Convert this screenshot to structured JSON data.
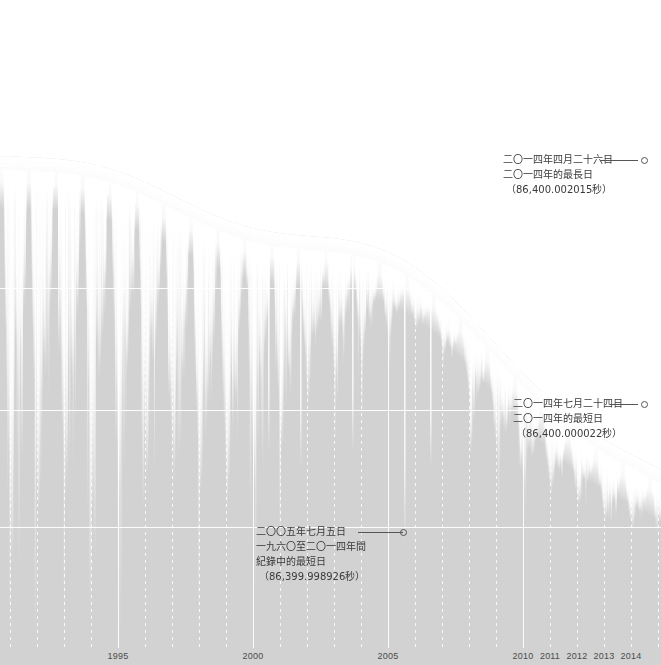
{
  "chart_data": {
    "type": "bar",
    "title": "",
    "subtitle": "",
    "xlabel": "",
    "ylabel": "",
    "grid": true,
    "legend_position": "none",
    "x_axis": {
      "tick_labels": [
        "1995",
        "2000",
        "2005",
        "2010",
        "2011",
        "2012",
        "2013",
        "2014"
      ],
      "tick_positions_px": [
        118,
        253,
        388,
        523,
        550,
        577,
        604,
        631
      ],
      "range": [
        "1960",
        "2014"
      ],
      "year_spacing_px": 27,
      "minor_gridline_years": [
        "1991",
        "1992",
        "1993",
        "1994",
        "1996",
        "1997",
        "1998",
        "1999",
        "2001",
        "2002",
        "2003",
        "2004",
        "2006",
        "2007",
        "2008",
        "2009",
        "2011",
        "2012",
        "2013",
        "2014"
      ]
    },
    "y_axis": {
      "gridline_positions_px": [
        165,
        288,
        410,
        527
      ],
      "range_seconds": [
        86399.998926,
        86400.002015
      ],
      "unit": "秒"
    },
    "annotations": [
      {
        "id": "longest-day-2014",
        "line1": "二〇一四年四月二十六日",
        "line2": "二〇一四年的最長日",
        "line3": "（86,400.002015秒）",
        "line4": "",
        "value_seconds": 86400.002015,
        "date": "2014-04-26",
        "text_left_px": 503,
        "text_top_px": 152,
        "leader_left_px": 600,
        "leader_top_px": 160,
        "leader_width_px": 38,
        "marker_left_px": 641,
        "marker_top_px": 157
      },
      {
        "id": "shortest-day-2014",
        "line1": "二〇一四年七月二十四日",
        "line2": "二〇一四年的最短日",
        "line3": "（86,400.000022秒）",
        "line4": "",
        "value_seconds": 86400.000022,
        "date": "2014-07-24",
        "text_left_px": 513,
        "text_top_px": 396,
        "leader_left_px": 610,
        "leader_top_px": 404,
        "leader_width_px": 28,
        "marker_left_px": 641,
        "marker_top_px": 401
      },
      {
        "id": "record-shortest-day",
        "line1": "二〇〇五年七月五日",
        "line2": "一九六〇至二〇一四年間",
        "line3": "紀錄中的最短日",
        "line4": "（86,399.998926秒）",
        "value_seconds": 86399.998926,
        "date": "2005-07-05",
        "text_left_px": 256,
        "text_top_px": 524,
        "leader_left_px": 358,
        "leader_top_px": 532,
        "leader_width_px": 45,
        "marker_left_px": 400,
        "marker_top_px": 529
      }
    ]
  },
  "colors": {
    "background": "#ffffff",
    "field": "#d2d2d2",
    "spike": "#ffffff",
    "gridline": "#ffffff",
    "axis_text": "#4b4b4b",
    "annotation_text": "#3a3a3a",
    "leader": "#555555"
  }
}
